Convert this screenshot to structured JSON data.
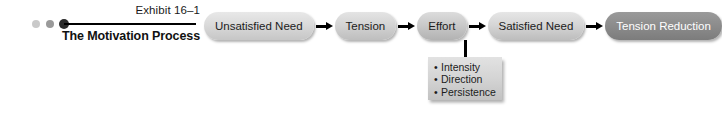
{
  "exhibit": {
    "number": "Exhibit 16–1",
    "title": "The Motivation Process",
    "dots": [
      "dot-light",
      "dot-medium",
      "dot-dark"
    ],
    "rule_color": "#000000"
  },
  "flow": {
    "arrow_icon": "arrow-right-icon",
    "steps": [
      {
        "label": "Unsatisfied Need",
        "fill": "#dadada",
        "text_color": "#1c1c1c"
      },
      {
        "label": "Tension",
        "fill": "#d4d4d4",
        "text_color": "#1c1c1c"
      },
      {
        "label": "Effort",
        "fill": "#cacaca",
        "text_color": "#1c1c1c"
      },
      {
        "label": "Satisfied Need",
        "fill": "#d6d6d6",
        "text_color": "#1c1c1c"
      },
      {
        "label": "Tension Reduction",
        "fill": "#8d8d8d",
        "text_color": "#ffffff"
      }
    ]
  },
  "effort_attributes": {
    "bullet": "•",
    "items": [
      {
        "label": "Intensity"
      },
      {
        "label": "Direction"
      },
      {
        "label": "Persistence"
      }
    ]
  }
}
